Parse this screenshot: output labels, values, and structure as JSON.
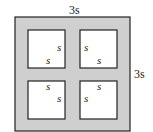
{
  "figure": {
    "outer_label_top": "3s",
    "outer_label_right": "3s",
    "outer_fill": "#cfcfcf",
    "inner_fill": "#ffffff",
    "stroke": "#222222",
    "inner_squares": [
      {
        "id": "top-left",
        "label_a": "s",
        "label_b": "s"
      },
      {
        "id": "top-right",
        "label_a": "s",
        "label_b": "s"
      },
      {
        "id": "bottom-left",
        "label_a": "s",
        "label_b": "s"
      },
      {
        "id": "bottom-right",
        "label_a": "s",
        "label_b": "s"
      }
    ]
  }
}
